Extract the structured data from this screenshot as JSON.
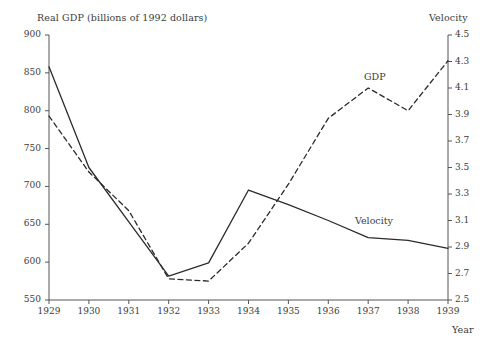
{
  "figure": {
    "left_axis_title": "Real GDP (billions of 1992 dollars)",
    "right_axis_title": "Velocity",
    "x_axis_title": "Year"
  },
  "labels": {
    "gdp": "GDP",
    "velocity": "Velocity"
  },
  "chart_data": {
    "type": "line",
    "title": "",
    "subtitle": "",
    "xlabel": "Year",
    "ylabel": "Real GDP (billions of 1992 dollars)",
    "y2label": "Velocity",
    "grid": false,
    "legend": "inline-annotations",
    "x": [
      1929,
      1930,
      1931,
      1932,
      1933,
      1934,
      1935,
      1936,
      1937,
      1938,
      1939
    ],
    "xtick_labels": [
      "1929",
      "1930",
      "1931",
      "1932",
      "1933",
      "1934",
      "1935",
      "1936",
      "1937",
      "1938",
      "1939"
    ],
    "xlim": [
      1929,
      1939
    ],
    "ylim": [
      550,
      900
    ],
    "ytick_labels": [
      "550",
      "600",
      "650",
      "700",
      "750",
      "800",
      "850",
      "900"
    ],
    "ytick_values": [
      550,
      600,
      650,
      700,
      750,
      800,
      850,
      900
    ],
    "y2lim": [
      2.5,
      4.5
    ],
    "y2tick_labels": [
      "2.5",
      "2.7",
      "2.9",
      "3.1",
      "3.3",
      "3.5",
      "3.7",
      "3.9",
      "4.1",
      "4.3",
      "4.5"
    ],
    "y2tick_values": [
      2.5,
      2.7,
      2.9,
      3.1,
      3.3,
      3.5,
      3.7,
      3.9,
      4.1,
      4.3,
      4.5
    ],
    "series": [
      {
        "name": "GDP",
        "axis": "left",
        "style": "dashed",
        "color": "#2b2b2b",
        "values": [
          793,
          719,
          668,
          578,
          575,
          625,
          703,
          790,
          830,
          800,
          866
        ]
      },
      {
        "name": "Velocity",
        "axis": "right",
        "style": "solid",
        "color": "#2b2b2b",
        "values": [
          4.26,
          3.5,
          3.09,
          2.68,
          2.78,
          3.33,
          3.22,
          3.1,
          2.97,
          2.95,
          2.89
        ]
      }
    ]
  }
}
